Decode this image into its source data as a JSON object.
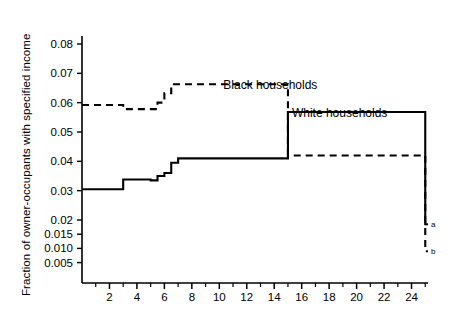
{
  "axes": {
    "ylabel": "Fraction of owner-occupants with specified income",
    "xlabel": "",
    "y_ticks": [
      "0.08",
      "0.07",
      "0.06",
      "0.05",
      "0.04",
      "0.03",
      "0.02",
      "0.015",
      "0.010",
      "0.005"
    ],
    "x_ticks": [
      "2",
      "4",
      "6",
      "8",
      "10",
      "12",
      "14",
      "16",
      "18",
      "20",
      "22",
      "24"
    ]
  },
  "annotations": {
    "black_label": "Black households",
    "white_label": "White households",
    "endpoint_a": "a",
    "endpoint_b": "b"
  },
  "chart_data": {
    "type": "line",
    "title": "",
    "xlabel": "",
    "ylabel": "Fraction of owner-occupants with specified income",
    "xlim": [
      0,
      25.2
    ],
    "ylim": [
      0.0,
      0.085
    ],
    "grid": false,
    "legend": "inline-annotations",
    "y_tick_values": [
      0.08,
      0.07,
      0.06,
      0.05,
      0.04,
      0.03,
      0.02,
      0.015,
      0.01,
      0.005
    ],
    "y_tick_labels": [
      "0.08",
      "0.07",
      "0.06",
      "0.05",
      "0.04",
      "0.03",
      "0.02",
      "0.015",
      "0.010",
      "0.005"
    ],
    "y_axis_note": "Axis is linear from 0.02 to 0.08; values below 0.02 (0.015, 0.010, 0.005) use a compressed secondary spacing",
    "x_tick_values": [
      2,
      4,
      6,
      8,
      10,
      12,
      14,
      16,
      18,
      20,
      22,
      24
    ],
    "x_minor_tick_values": [
      1,
      3,
      5,
      7,
      9,
      11,
      13,
      15,
      17,
      19,
      21,
      23,
      25
    ],
    "drawstyle": "steps-post",
    "series": [
      {
        "name": "Black households",
        "linestyle": "dashed",
        "color": "#000000",
        "endpoint_label": "b",
        "x": [
          0,
          1,
          3,
          5,
          5.5,
          6,
          6.5,
          10,
          15,
          25
        ],
        "values": [
          0.0592,
          0.0592,
          0.0578,
          0.0578,
          0.06,
          0.0632,
          0.0663,
          0.0663,
          0.042,
          0.009
        ]
      },
      {
        "name": "White households",
        "linestyle": "solid",
        "color": "#000000",
        "endpoint_label": "a",
        "x": [
          0,
          2,
          3,
          5,
          5.5,
          6,
          6.5,
          7,
          15,
          25
        ],
        "values": [
          0.0305,
          0.0305,
          0.0338,
          0.0335,
          0.035,
          0.036,
          0.0395,
          0.041,
          0.0568,
          0.0185
        ]
      }
    ]
  }
}
